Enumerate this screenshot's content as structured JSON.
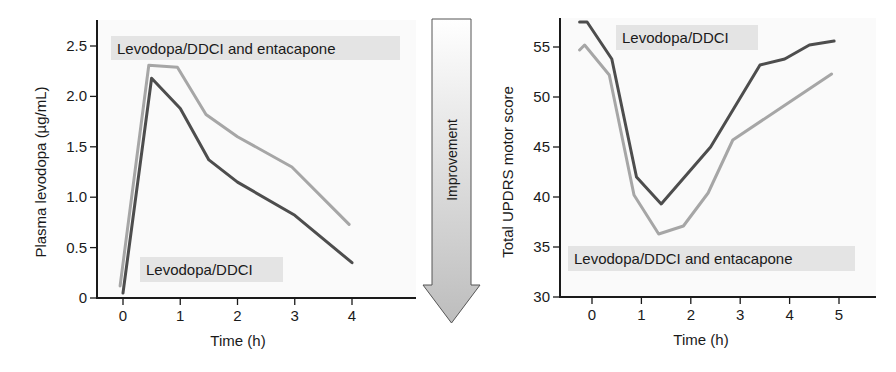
{
  "colors": {
    "dark_series": "#4d4d4d",
    "light_series": "#a6a6a6",
    "legend_box": "#e4e4e4",
    "axis": "#1a1a1a",
    "plot_bg": "#fafafa"
  },
  "arrow": {
    "label": "Improvement"
  },
  "chart_data": [
    {
      "type": "line",
      "title": "",
      "xlabel": "Time (h)",
      "ylabel": "Plasma levodopa (µg/mL)",
      "xlim": [
        -0.45,
        5.0
      ],
      "ylim": [
        0,
        2.7
      ],
      "xticks": [
        0,
        1,
        2,
        3,
        4
      ],
      "xtick_labels": [
        "0",
        "1",
        "2",
        "3",
        "4"
      ],
      "yticks": [
        0,
        0.5,
        1.0,
        1.5,
        2.0,
        2.5
      ],
      "ytick_labels": [
        "0",
        "0.5",
        "1.0",
        "1.5",
        "2.0",
        "2.5"
      ],
      "grid": false,
      "series": [
        {
          "name": "Levodopa/DDCI and entacapone",
          "color": "light",
          "x": [
            -0.05,
            0.45,
            0.95,
            1.45,
            2.0,
            2.95,
            3.95
          ],
          "y": [
            0.12,
            2.31,
            2.29,
            1.82,
            1.6,
            1.3,
            0.73
          ]
        },
        {
          "name": "Levodopa/DDCI",
          "color": "dark",
          "x": [
            0.0,
            0.5,
            1.0,
            1.5,
            2.0,
            3.0,
            4.0
          ],
          "y": [
            0.05,
            2.18,
            1.88,
            1.37,
            1.15,
            0.82,
            0.35
          ]
        }
      ],
      "annotations": [
        {
          "text": "Levodopa/DDCI and entacapone",
          "series": "light",
          "position": "top"
        },
        {
          "text": "Levodopa/DDCI",
          "series": "dark",
          "position": "bottom"
        }
      ]
    },
    {
      "type": "line",
      "title": "",
      "xlabel": "Time (h)",
      "ylabel": "Total UPDRS motor score",
      "xlim": [
        -0.65,
        5.5
      ],
      "ylim": [
        30,
        58
      ],
      "xticks": [
        0,
        1,
        2,
        3,
        4,
        5
      ],
      "xtick_labels": [
        "0",
        "1",
        "2",
        "3",
        "4",
        "5"
      ],
      "yticks": [
        30,
        35,
        40,
        45,
        50,
        55
      ],
      "ytick_labels": [
        "30",
        "35",
        "40",
        "45",
        "50",
        "55"
      ],
      "grid": false,
      "series": [
        {
          "name": "Levodopa/DDCI",
          "color": "dark",
          "x": [
            -0.25,
            -0.1,
            0.4,
            0.9,
            1.4,
            2.4,
            3.4,
            3.9,
            4.4,
            4.9
          ],
          "y": [
            57.5,
            57.5,
            53.8,
            42.0,
            39.3,
            45.0,
            53.2,
            53.8,
            55.2,
            55.6
          ]
        },
        {
          "name": "Levodopa/DDCI and entacapone",
          "color": "light",
          "x": [
            -0.25,
            -0.15,
            0.35,
            0.85,
            1.35,
            1.85,
            2.35,
            2.85,
            3.85,
            4.85
          ],
          "y": [
            54.7,
            55.2,
            52.2,
            40.2,
            36.3,
            37.1,
            40.4,
            45.7,
            49.0,
            52.3
          ]
        }
      ],
      "annotations": [
        {
          "text": "Levodopa/DDCI",
          "series": "dark",
          "position": "top"
        },
        {
          "text": "Levodopa/DDCI and entacapone",
          "series": "light",
          "position": "bottom"
        }
      ]
    }
  ]
}
